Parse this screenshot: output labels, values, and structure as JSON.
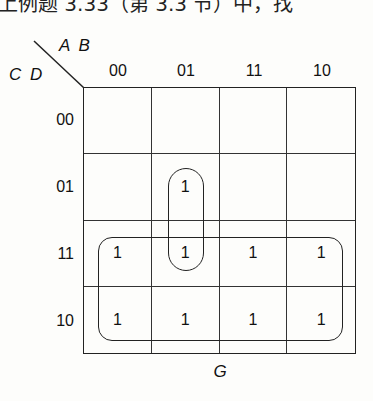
{
  "top_text": "上例题 3.33（第 3.3 节）中，找",
  "kmap": {
    "row_variables": "C D",
    "col_variables": "A B",
    "col_labels": [
      "00",
      "01",
      "11",
      "10"
    ],
    "row_labels": [
      "00",
      "01",
      "11",
      "10"
    ],
    "cells": [
      [
        "",
        "",
        "",
        ""
      ],
      [
        "",
        "1",
        "",
        ""
      ],
      [
        "1",
        "1",
        "1",
        "1"
      ],
      [
        "1",
        "1",
        "1",
        "1"
      ]
    ],
    "groups": [
      {
        "name": "vertical-pair",
        "cells": "AB=01, CD=01..11"
      },
      {
        "name": "horizontal-octet",
        "cells": "CD=11..10, all AB"
      }
    ],
    "function_name": "G"
  }
}
